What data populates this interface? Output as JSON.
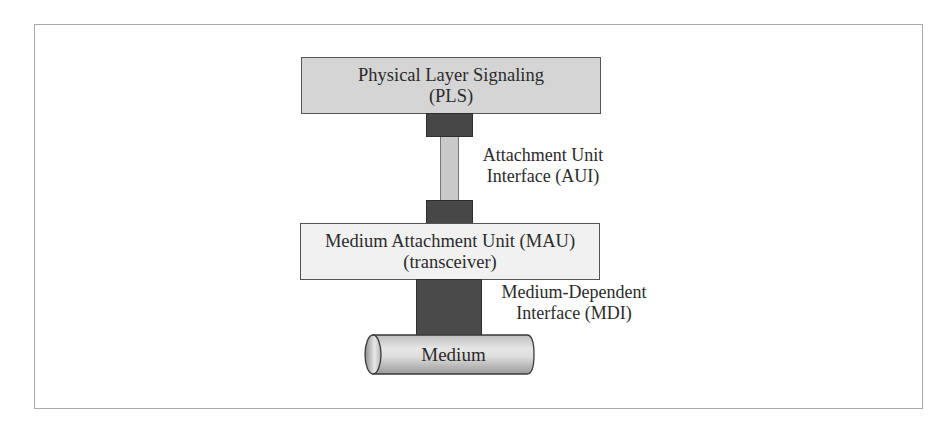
{
  "diagram": {
    "title": "",
    "nodes": {
      "pls": {
        "line1": "Physical Layer Signaling",
        "line2": "(PLS)"
      },
      "mau": {
        "line1": "Medium Attachment Unit (MAU)",
        "line2": "(transceiver)"
      },
      "medium": {
        "label": "Medium"
      }
    },
    "interfaces": {
      "aui": {
        "line1": "Attachment Unit",
        "line2": "Interface (AUI)"
      },
      "mdi": {
        "line1": "Medium-Dependent",
        "line2": "Interface (MDI)"
      }
    },
    "edges": [
      {
        "from": "pls",
        "to": "mau",
        "via": "aui"
      },
      {
        "from": "mau",
        "to": "medium",
        "via": "mdi"
      }
    ],
    "colors": {
      "pls_fill": "#d5d5d5",
      "mau_fill": "#f1f1f1",
      "connector_dark": "#474747",
      "aui_cable": "#c9c9c9",
      "frame_border": "#a9a9a9"
    }
  }
}
